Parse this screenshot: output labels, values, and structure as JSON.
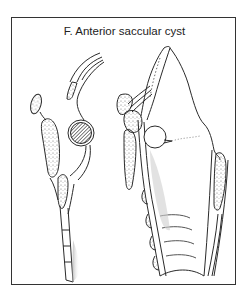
{
  "figure": {
    "title": "F.  Anterior saccular cyst",
    "panel_letter": "F",
    "caption_text": "Anterior saccular cyst"
  },
  "colors": {
    "line": "#2a2a2a",
    "frame": "#333333",
    "stipple": "#6a6a6a",
    "shade": "#bdbdbd",
    "cyst_hatch": "#3a3a3a",
    "background": "#ffffff"
  },
  "illustrations": [
    {
      "id": "left-view",
      "description": "Sagittal section showing epiglottis, hyoid and hatched cyst"
    },
    {
      "id": "right-view",
      "description": "Larynx view with saccular cyst bulge and tracheal rings"
    }
  ]
}
